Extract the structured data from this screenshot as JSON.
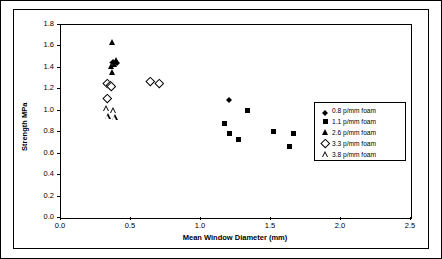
{
  "chart_data": {
    "type": "scatter",
    "title": "",
    "xlabel": "Mean Window Diameter  (mm)",
    "ylabel": "Strength  MPa",
    "xlim": [
      0.0,
      2.5
    ],
    "ylim": [
      0.0,
      1.8
    ],
    "xticks": [
      "0.0",
      "0.5",
      "1.0",
      "1.5",
      "2.0",
      "2.5"
    ],
    "yticks": [
      "0.0",
      "0.2",
      "0.4",
      "0.6",
      "0.8",
      "1.0",
      "1.2",
      "1.4",
      "1.6",
      "1.8"
    ],
    "grid": false,
    "legend_position": "bottom-right",
    "series": [
      {
        "name": "0.8 p/mm foam",
        "marker": "diamond-filled",
        "points": [
          {
            "x": 1.2,
            "y": 1.13
          },
          {
            "x": 1.93,
            "y": 0.97
          },
          {
            "x": 2.03,
            "y": 0.96
          },
          {
            "x": 0.37,
            "y": 1.48
          },
          {
            "x": 0.4,
            "y": 1.47
          }
        ]
      },
      {
        "name": "1.1 p/mm foam",
        "marker": "square-filled",
        "points": [
          {
            "x": 1.17,
            "y": 0.88
          },
          {
            "x": 1.2,
            "y": 0.79
          },
          {
            "x": 1.27,
            "y": 0.73
          },
          {
            "x": 1.33,
            "y": 1.0
          },
          {
            "x": 1.52,
            "y": 0.81
          },
          {
            "x": 1.66,
            "y": 0.79
          },
          {
            "x": 1.63,
            "y": 0.67
          }
        ]
      },
      {
        "name": "2.6 p/mm foam",
        "marker": "triangle-filled",
        "points": [
          {
            "x": 0.37,
            "y": 1.64
          },
          {
            "x": 0.36,
            "y": 1.42
          },
          {
            "x": 0.37,
            "y": 1.36
          },
          {
            "x": 0.4,
            "y": 1.47
          },
          {
            "x": 0.38,
            "y": 1.44
          }
        ]
      },
      {
        "name": "3.3 p/mm foam",
        "marker": "diamond-hollow",
        "points": [
          {
            "x": 0.33,
            "y": 1.26
          },
          {
            "x": 0.35,
            "y": 1.24
          },
          {
            "x": 0.36,
            "y": 1.23
          },
          {
            "x": 0.33,
            "y": 1.12
          },
          {
            "x": 0.64,
            "y": 1.28
          },
          {
            "x": 0.7,
            "y": 1.26
          }
        ]
      },
      {
        "name": "3.8 p/mm foam",
        "marker": "triangle-hollow",
        "points": [
          {
            "x": 0.33,
            "y": 1.02
          },
          {
            "x": 0.38,
            "y": 1.01
          },
          {
            "x": 0.34,
            "y": 0.95
          },
          {
            "x": 0.39,
            "y": 0.94
          }
        ]
      }
    ]
  },
  "legend": {
    "items": [
      {
        "label": "0.8 p/mm foam",
        "marker": "diamond-filled"
      },
      {
        "label": "1.1 p/mm foam",
        "marker": "square-filled"
      },
      {
        "label": "2.6 p/mm foam",
        "marker": "triangle-filled"
      },
      {
        "label": "3.3 p/mm foam",
        "marker": "diamond-hollow"
      },
      {
        "label": "3.8 p/mm foam",
        "marker": "triangle-hollow"
      }
    ]
  }
}
